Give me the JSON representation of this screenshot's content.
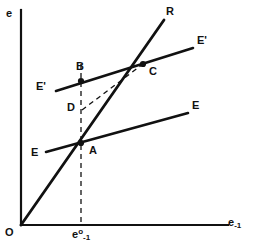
{
  "figure": {
    "type": "diagram",
    "background_color": "#ffffff",
    "line_color": "#111111",
    "axes": {
      "y_label": "e",
      "x_label_base": "e",
      "x_label_sub": "-1",
      "origin_label": "O",
      "x_axis": {
        "x1": 21,
        "y1": 225,
        "x2": 228,
        "y2": 225
      },
      "y_axis": {
        "x1": 21,
        "y1": 10,
        "x2": 21,
        "y2": 225
      }
    },
    "tick": {
      "label_base": "e",
      "label_sup": "o",
      "label_sub": "-1",
      "x": 81
    },
    "lines": [
      {
        "name": "R-ray",
        "label": "R",
        "style": "solid",
        "width": 2.6,
        "points": [
          [
            21,
            225
          ],
          [
            164,
            20
          ]
        ]
      },
      {
        "name": "EE-schedule",
        "label_left": "E",
        "label_right": "E",
        "style": "solid",
        "width": 2.4,
        "points": [
          [
            46,
            152
          ],
          [
            188,
            113
          ]
        ]
      },
      {
        "name": "E-prime-schedule",
        "label_left": "E'",
        "label_right": "E'",
        "style": "solid",
        "width": 2.4,
        "points": [
          [
            56,
            91
          ],
          [
            193,
            48
          ]
        ]
      },
      {
        "name": "vertical-dashed-guide",
        "style": "dashed",
        "width": 1.3,
        "points": [
          [
            81,
            64
          ],
          [
            81,
            225
          ]
        ]
      },
      {
        "name": "DC-dashed-segment",
        "style": "dashed",
        "width": 1.3,
        "points": [
          [
            82,
            110
          ],
          [
            143,
            64
          ]
        ]
      }
    ],
    "points": [
      {
        "name": "A",
        "label": "A",
        "x": 81,
        "y": 143,
        "label_x": 89,
        "label_y": 145
      },
      {
        "name": "B",
        "label": "B",
        "x": 81,
        "y": 81,
        "label_x": 76,
        "label_y": 62
      },
      {
        "name": "C",
        "label": "C",
        "x": 143,
        "y": 64,
        "label_x": 149,
        "label_y": 66
      },
      {
        "name": "D",
        "label": "D",
        "x": 81,
        "y": 110,
        "label_x": 68,
        "label_y": 103
      }
    ],
    "text_labels": {
      "y_axis": {
        "text": "e",
        "x": 6,
        "y": 8
      },
      "origin": {
        "text": "O",
        "x": 6,
        "y": 227
      },
      "R": {
        "text": "R",
        "x": 166,
        "y": 7
      },
      "E_prime_right": {
        "text": "E'",
        "x": 197,
        "y": 36
      },
      "E_prime_left": {
        "text": "E'",
        "x": 37,
        "y": 80
      },
      "E_right": {
        "text": "E",
        "x": 193,
        "y": 100
      },
      "E_left": {
        "text": "E",
        "x": 31,
        "y": 147
      }
    }
  }
}
